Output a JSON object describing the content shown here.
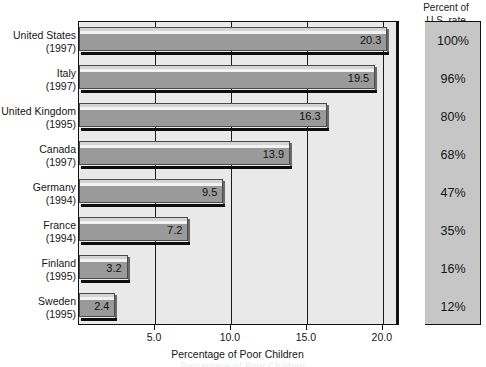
{
  "chart_data": {
    "type": "bar",
    "orientation": "horizontal",
    "title": "",
    "xlabel": "Percentage of Poor Children",
    "ylabel": "",
    "xlim": [
      0,
      21.0
    ],
    "xticks": [
      "5.0",
      "10.0",
      "15.0",
      "20.0"
    ],
    "xtick_values": [
      5.0,
      10.0,
      15.0,
      20.0
    ],
    "grid": true,
    "legend": null,
    "categories": [
      "United States\n(1997)",
      "Italy\n(1997)",
      "United Kingdom\n(1995)",
      "Canada\n(1997)",
      "Germany\n(1994)",
      "France\n(1994)",
      "Finland\n(1995)",
      "Sweden\n(1995)"
    ],
    "values": [
      20.3,
      19.5,
      16.3,
      13.9,
      9.5,
      7.2,
      3.2,
      2.4
    ],
    "bar_color": "#9a9a9a",
    "plot_background": "#e9e9e9",
    "panel_background": "#c6c6c6"
  },
  "panel": {
    "header_line1": "Percent of",
    "header_line2": "U.S. rate"
  },
  "rows": [
    {
      "country": "United States",
      "year": "(1997)",
      "value": "20.3",
      "num": 20.3,
      "percent": "100%"
    },
    {
      "country": "Italy",
      "year": "(1997)",
      "value": "19.5",
      "num": 19.5,
      "percent": "96%"
    },
    {
      "country": "United Kingdom",
      "year": "(1995)",
      "value": "16.3",
      "num": 16.3,
      "percent": "80%"
    },
    {
      "country": "Canada",
      "year": "(1997)",
      "value": "13.9",
      "num": 13.9,
      "percent": "68%"
    },
    {
      "country": "Germany",
      "year": "(1994)",
      "value": "9.5",
      "num": 9.5,
      "percent": "47%"
    },
    {
      "country": "France",
      "year": "(1994)",
      "value": "7.2",
      "num": 7.2,
      "percent": "35%"
    },
    {
      "country": "Finland",
      "year": "(1995)",
      "value": "3.2",
      "num": 3.2,
      "percent": "16%"
    },
    {
      "country": "Sweden",
      "year": "(1995)",
      "value": "2.4",
      "num": 2.4,
      "percent": "12%"
    }
  ],
  "axis": {
    "title": "Percentage of Poor Children",
    "ticks": [
      "5.0",
      "10.0",
      "15.0",
      "20.0"
    ]
  }
}
